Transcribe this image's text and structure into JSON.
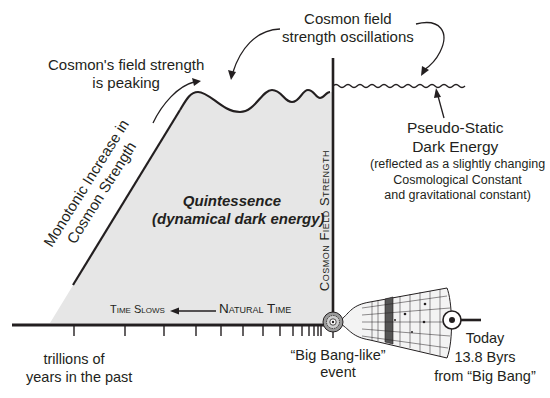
{
  "diagram": {
    "type": "cosmology-timeline",
    "colors": {
      "ink": "#231f20",
      "shade": "#e6e6e6",
      "cone_band": "#555555",
      "background": "#ffffff"
    },
    "annotations": {
      "peaking": [
        "Cosmon's field strength",
        "is peaking"
      ],
      "oscillations": [
        "Cosmon field",
        "strength oscillations"
      ],
      "pseudo_static_title": [
        "Pseudo-Static",
        "Dark Energy"
      ],
      "pseudo_static_note": [
        "(reflected as a slightly changing",
        "Cosmological Constant",
        "and gravitational constant)"
      ],
      "monotonic": [
        "Monotonic Increase in",
        "Cosmon Strength"
      ],
      "quintessence_title": "Quintessence",
      "quintessence_subtitle": "(dynamical dark energy)",
      "vertical_axis": "Cosmon Field Strength",
      "time_slows": "Time Slows",
      "natural_time": "Natural Time",
      "past_label": [
        "trillions of",
        "years in the past"
      ],
      "big_bang_label": [
        "“Big Bang-like”",
        "event"
      ],
      "today_label": [
        "Today",
        "13.8 Byrs",
        "from “Big Bang”"
      ]
    },
    "icons": {
      "big_bang": "starburst-circle-icon",
      "today": "target-dot-icon",
      "universe": "expanding-universe-cone-icon"
    }
  }
}
